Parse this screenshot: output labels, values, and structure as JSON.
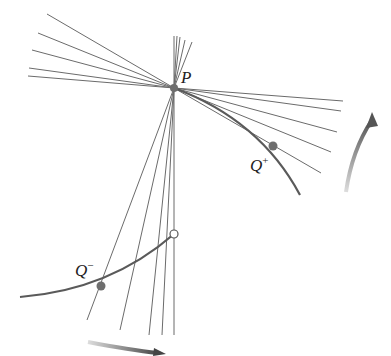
{
  "labels": {
    "p": "P",
    "q_plus": "Q",
    "q_plus_sup": "+",
    "q_minus": "Q",
    "q_minus_sup": "−"
  },
  "colors": {
    "line": "#6b6b6b",
    "curve": "#5a5a5a",
    "point": "#6e6e6e",
    "arrow": "#5c5c5c"
  },
  "points": {
    "P": [
      174,
      88
    ],
    "Q_plus": [
      273,
      146
    ],
    "Q_minus": [
      101,
      286
    ],
    "open_point": [
      174,
      234
    ]
  }
}
